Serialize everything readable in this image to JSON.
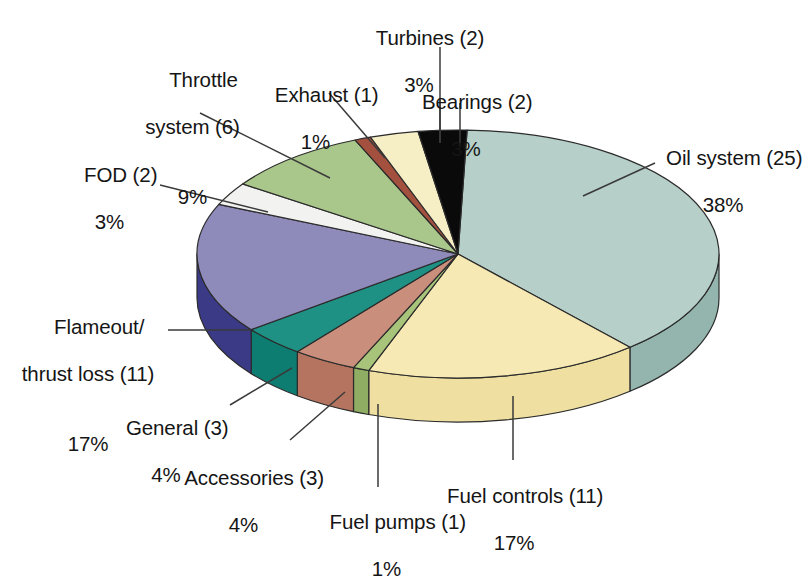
{
  "chart_data": {
    "type": "pie",
    "title": "",
    "subtitle": "",
    "xlabel": "",
    "ylabel": "",
    "legend_position": "none",
    "grid": false,
    "total_count": 66,
    "value_unit": "events",
    "style": "3d-exploded-none",
    "categories": [
      "Oil system",
      "Fuel controls",
      "Fuel pumps",
      "Accessories",
      "General",
      "Flameout/thrust loss",
      "FOD",
      "Throttle system",
      "Exhaust",
      "Turbines",
      "Bearings"
    ],
    "counts": [
      25,
      11,
      1,
      3,
      3,
      11,
      2,
      6,
      1,
      2,
      2
    ],
    "values": [
      38,
      17,
      1,
      4,
      4,
      17,
      3,
      9,
      1,
      3,
      3
    ],
    "colors": [
      "#b6cfc9",
      "#f7e9b4",
      "#a8c37a",
      "#c98f7c",
      "#1f9184",
      "#8e8ab9",
      "#f2f3f1",
      "#a9c68b",
      "#a3503f",
      "#f6eec5",
      "#0a0a0a"
    ],
    "side_colors": [
      "#93b5ae",
      "#efe0a1",
      "#8fae64",
      "#b4745f",
      "#0d7d71",
      "#3b3a86",
      "#dadedc",
      "#8fb172",
      "#8c4334",
      "#e4d9ab",
      "#050505"
    ]
  },
  "labels": [
    {
      "id": "turbines",
      "name": "Turbines (2)",
      "percent": "3%",
      "align": "center"
    },
    {
      "id": "throttle-system",
      "name": "Throttle\nsystem (6)",
      "percent": "9%",
      "align": "center"
    },
    {
      "id": "exhaust",
      "name": "Exhaust (1)",
      "percent": "1%",
      "align": "center"
    },
    {
      "id": "bearings",
      "name": "Bearings (2)",
      "percent": "3%",
      "align": "center"
    },
    {
      "id": "oil-system",
      "name": "Oil system (25)",
      "percent": "38%",
      "align": "center"
    },
    {
      "id": "fod",
      "name": "FOD (2)",
      "percent": "3%",
      "align": "center"
    },
    {
      "id": "flameout-thrust-loss",
      "name": "Flameout/\nthrust loss (11)",
      "percent": "17%",
      "align": "center"
    },
    {
      "id": "general",
      "name": "General (3)",
      "percent": "4%",
      "align": "center"
    },
    {
      "id": "accessories",
      "name": "Accessories (3)",
      "percent": "4%",
      "align": "center"
    },
    {
      "id": "fuel-pumps",
      "name": "Fuel pumps (1)",
      "percent": "1%",
      "align": "center"
    },
    {
      "id": "fuel-controls",
      "name": "Fuel controls (11)",
      "percent": "17%",
      "align": "center"
    }
  ],
  "label_text": {
    "turbines_name": "Turbines (2)",
    "turbines_pct": "3%",
    "throttle_name_1": "Throttle",
    "throttle_name_2": "system (6)",
    "throttle_pct": "9%",
    "exhaust_name": "Exhaust (1)",
    "exhaust_pct": "1%",
    "bearings_name": "Bearings (2)",
    "bearings_pct": "3%",
    "oil_name": "Oil system (25)",
    "oil_pct": "38%",
    "fod_name": "FOD (2)",
    "fod_pct": "3%",
    "flameout_name_1": "Flameout/",
    "flameout_name_2": "thrust loss (11)",
    "flameout_pct": "17%",
    "general_name": "General (3)",
    "general_pct": "4%",
    "accessories_name": "Accessories (3)",
    "accessories_pct": "4%",
    "fuelpumps_name": "Fuel pumps (1)",
    "fuelpumps_pct": "1%",
    "fuelcontrols_name": "Fuel controls (11)",
    "fuelcontrols_pct": "17%"
  },
  "geometry": {
    "cx": 458,
    "cy": 254,
    "rx": 261,
    "ry": 124,
    "depth": 44,
    "stroke": "#2b2b2b",
    "leader_color": "#3a3a3a"
  }
}
